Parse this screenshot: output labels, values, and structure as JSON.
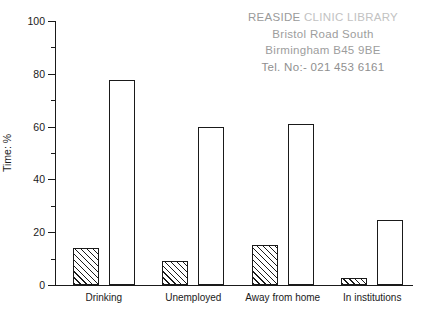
{
  "stamp": {
    "line1_main": "REASIDE",
    "line1_fade": "CLINIC LIBRARY",
    "line2": "Bristol Road South",
    "line3": "Birmingham B45  9BE",
    "line4": "Tel. No:- 021 453  6161"
  },
  "chart_data": {
    "type": "bar",
    "title": "",
    "subtitle": "",
    "xlabel": "",
    "ylabel": "Time: %",
    "ylim": [
      0,
      100
    ],
    "ytick_labels": [
      "0",
      "20",
      "40",
      "60",
      "80",
      "100"
    ],
    "ytick_values": [
      0,
      20,
      40,
      60,
      80,
      100
    ],
    "yminor_values": [
      10,
      30,
      50,
      70,
      90
    ],
    "grid": false,
    "legend": "none",
    "categories": [
      "Drinking",
      "Unemployed",
      "Away from home",
      "In institutions"
    ],
    "series": [
      {
        "name": "hatched",
        "fill": "diagonal-hatch",
        "values": [
          14,
          9,
          15,
          2.5
        ]
      },
      {
        "name": "open",
        "fill": "white",
        "values": [
          77.5,
          60,
          61,
          24.5
        ]
      }
    ],
    "axis_color": "#1a1a1a",
    "bar_edge_color": "#1a1a1a",
    "bar_face_color": "#ffffff"
  }
}
